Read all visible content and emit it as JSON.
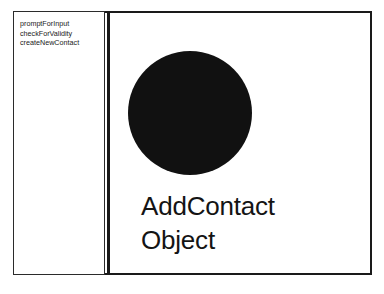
{
  "diagram": {
    "type": "object-responsibility-card",
    "colors": {
      "background": "#ffffff",
      "frame_border": "#1a1a1a",
      "divider": "#1a1a1a",
      "circle_fill": "#111111",
      "text": "#141414",
      "list_text": "#1a1a1a"
    },
    "left_panel": {
      "responsibilities": [
        {
          "label": "promptForInput"
        },
        {
          "label": "checkForValidity"
        },
        {
          "label": "createNewContact"
        }
      ]
    },
    "right_panel": {
      "shape": "filled-circle",
      "title_lines": [
        {
          "text": "AddContact"
        },
        {
          "text": "Object"
        }
      ]
    }
  }
}
